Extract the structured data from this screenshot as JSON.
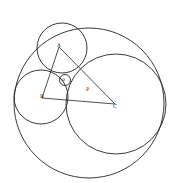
{
  "diagram": {
    "labels": {
      "a": "A",
      "b": "B",
      "c": "C",
      "p": "P",
      "small": "ρ"
    },
    "stroke_color": "#222222"
  }
}
